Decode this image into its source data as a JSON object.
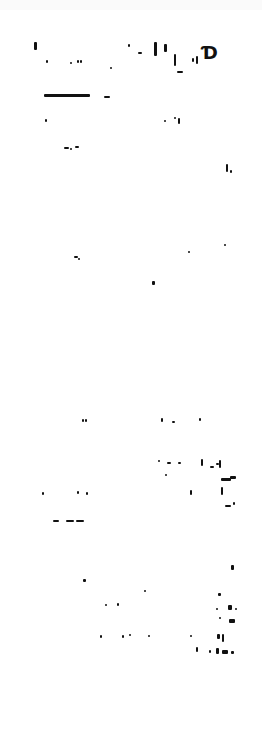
{
  "page": {
    "background": "#ffffff",
    "text_legible": false
  },
  "header": {
    "logo_glyph": "Ɗ",
    "fragments": [
      {
        "x": 34,
        "y": 42,
        "w": 3,
        "h": 8
      },
      {
        "x": 46,
        "y": 60,
        "w": 2,
        "h": 3
      },
      {
        "x": 70,
        "y": 62,
        "w": 2,
        "h": 2
      },
      {
        "x": 77,
        "y": 60,
        "w": 2,
        "h": 3
      },
      {
        "x": 80,
        "y": 60,
        "w": 2,
        "h": 3
      },
      {
        "x": 110,
        "y": 67,
        "w": 2,
        "h": 2
      },
      {
        "x": 128,
        "y": 44,
        "w": 2,
        "h": 3
      },
      {
        "x": 138,
        "y": 52,
        "w": 4,
        "h": 2
      },
      {
        "x": 154,
        "y": 42,
        "w": 3,
        "h": 14
      },
      {
        "x": 164,
        "y": 44,
        "w": 3,
        "h": 8
      },
      {
        "x": 174,
        "y": 54,
        "w": 2,
        "h": 12
      },
      {
        "x": 177,
        "y": 71,
        "w": 6,
        "h": 2
      },
      {
        "x": 192,
        "y": 58,
        "w": 2,
        "h": 4
      },
      {
        "x": 196,
        "y": 56,
        "w": 2,
        "h": 8
      }
    ]
  },
  "divider": {
    "x": 44,
    "y": 94,
    "w": 46,
    "h": 3
  },
  "divider_tail": {
    "x": 104,
    "y": 96,
    "w": 6,
    "h": 2
  },
  "row1": [
    {
      "x": 45,
      "y": 119,
      "w": 2,
      "h": 3
    },
    {
      "x": 164,
      "y": 120,
      "w": 2,
      "h": 2
    },
    {
      "x": 174,
      "y": 117,
      "w": 2,
      "h": 2
    },
    {
      "x": 178,
      "y": 118,
      "w": 2,
      "h": 6
    }
  ],
  "middle": [
    {
      "x": 64,
      "y": 147,
      "w": 5,
      "h": 2
    },
    {
      "x": 70,
      "y": 148,
      "w": 2,
      "h": 2
    },
    {
      "x": 75,
      "y": 146,
      "w": 4,
      "h": 2
    },
    {
      "x": 226,
      "y": 164,
      "w": 2,
      "h": 8
    },
    {
      "x": 230,
      "y": 170,
      "w": 2,
      "h": 3
    },
    {
      "x": 74,
      "y": 256,
      "w": 4,
      "h": 2
    },
    {
      "x": 78,
      "y": 258,
      "w": 2,
      "h": 2
    },
    {
      "x": 188,
      "y": 251,
      "w": 2,
      "h": 2
    },
    {
      "x": 224,
      "y": 244,
      "w": 2,
      "h": 2
    },
    {
      "x": 152,
      "y": 281,
      "w": 3,
      "h": 4
    }
  ],
  "lower": [
    {
      "x": 82,
      "y": 419,
      "w": 2,
      "h": 3
    },
    {
      "x": 85,
      "y": 419,
      "w": 2,
      "h": 3
    },
    {
      "x": 161,
      "y": 418,
      "w": 2,
      "h": 4
    },
    {
      "x": 172,
      "y": 421,
      "w": 3,
      "h": 2
    },
    {
      "x": 199,
      "y": 418,
      "w": 2,
      "h": 3
    },
    {
      "x": 158,
      "y": 460,
      "w": 2,
      "h": 2
    },
    {
      "x": 167,
      "y": 462,
      "w": 4,
      "h": 2
    },
    {
      "x": 178,
      "y": 462,
      "w": 3,
      "h": 2
    },
    {
      "x": 201,
      "y": 459,
      "w": 2,
      "h": 7
    },
    {
      "x": 210,
      "y": 466,
      "w": 4,
      "h": 2
    },
    {
      "x": 216,
      "y": 463,
      "w": 3,
      "h": 2
    },
    {
      "x": 219,
      "y": 460,
      "w": 2,
      "h": 8
    },
    {
      "x": 165,
      "y": 474,
      "w": 2,
      "h": 2
    },
    {
      "x": 221,
      "y": 478,
      "w": 10,
      "h": 3
    },
    {
      "x": 230,
      "y": 476,
      "w": 6,
      "h": 3
    },
    {
      "x": 42,
      "y": 492,
      "w": 2,
      "h": 3
    },
    {
      "x": 77,
      "y": 491,
      "w": 2,
      "h": 3
    },
    {
      "x": 86,
      "y": 492,
      "w": 2,
      "h": 3
    },
    {
      "x": 190,
      "y": 490,
      "w": 2,
      "h": 5
    },
    {
      "x": 221,
      "y": 487,
      "w": 2,
      "h": 8
    },
    {
      "x": 225,
      "y": 505,
      "w": 6,
      "h": 2
    },
    {
      "x": 233,
      "y": 502,
      "w": 2,
      "h": 3
    },
    {
      "x": 53,
      "y": 520,
      "w": 6,
      "h": 2
    },
    {
      "x": 66,
      "y": 520,
      "w": 8,
      "h": 2
    },
    {
      "x": 76,
      "y": 520,
      "w": 8,
      "h": 2
    }
  ],
  "bottom": [
    {
      "x": 231,
      "y": 565,
      "w": 3,
      "h": 5
    },
    {
      "x": 83,
      "y": 579,
      "w": 3,
      "h": 3
    },
    {
      "x": 144,
      "y": 590,
      "w": 2,
      "h": 2
    },
    {
      "x": 218,
      "y": 593,
      "w": 3,
      "h": 3
    },
    {
      "x": 105,
      "y": 604,
      "w": 2,
      "h": 2
    },
    {
      "x": 117,
      "y": 603,
      "w": 2,
      "h": 3
    },
    {
      "x": 216,
      "y": 608,
      "w": 2,
      "h": 2
    },
    {
      "x": 228,
      "y": 605,
      "w": 4,
      "h": 5
    },
    {
      "x": 235,
      "y": 608,
      "w": 2,
      "h": 2
    },
    {
      "x": 219,
      "y": 617,
      "w": 2,
      "h": 2
    },
    {
      "x": 229,
      "y": 619,
      "w": 6,
      "h": 4
    },
    {
      "x": 100,
      "y": 635,
      "w": 2,
      "h": 3
    },
    {
      "x": 122,
      "y": 635,
      "w": 2,
      "h": 3
    },
    {
      "x": 129,
      "y": 634,
      "w": 2,
      "h": 2
    },
    {
      "x": 148,
      "y": 635,
      "w": 2,
      "h": 2
    },
    {
      "x": 190,
      "y": 635,
      "w": 2,
      "h": 2
    },
    {
      "x": 217,
      "y": 634,
      "w": 3,
      "h": 5
    },
    {
      "x": 222,
      "y": 634,
      "w": 2,
      "h": 8
    },
    {
      "x": 196,
      "y": 647,
      "w": 2,
      "h": 5
    },
    {
      "x": 209,
      "y": 650,
      "w": 2,
      "h": 3
    },
    {
      "x": 216,
      "y": 648,
      "w": 3,
      "h": 6
    },
    {
      "x": 222,
      "y": 650,
      "w": 6,
      "h": 4
    },
    {
      "x": 231,
      "y": 651,
      "w": 3,
      "h": 3
    }
  ]
}
